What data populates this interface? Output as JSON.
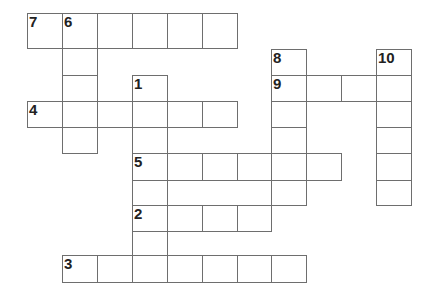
{
  "puzzle": {
    "type": "crossword",
    "colors": {
      "border": "#6e6e6e",
      "background": "#ffffff",
      "number": "#222222"
    },
    "col_x": [
      27,
      62,
      97,
      132,
      167,
      202,
      237,
      271,
      306,
      341,
      376,
      411
    ],
    "row_y": [
      13,
      48,
      75,
      101,
      127,
      153,
      180,
      205,
      231,
      255,
      282
    ],
    "cells": [
      {
        "c": 0,
        "r": 0,
        "n": "7"
      },
      {
        "c": 1,
        "r": 0,
        "n": "6"
      },
      {
        "c": 2,
        "r": 0
      },
      {
        "c": 3,
        "r": 0
      },
      {
        "c": 4,
        "r": 0
      },
      {
        "c": 5,
        "r": 0
      },
      {
        "c": 1,
        "r": 1
      },
      {
        "c": 1,
        "r": 2
      },
      {
        "c": 1,
        "r": 3
      },
      {
        "c": 1,
        "r": 4
      },
      {
        "c": 3,
        "r": 2,
        "n": "1"
      },
      {
        "c": 0,
        "r": 3,
        "n": "4"
      },
      {
        "c": 2,
        "r": 3
      },
      {
        "c": 3,
        "r": 3
      },
      {
        "c": 4,
        "r": 3
      },
      {
        "c": 5,
        "r": 3
      },
      {
        "c": 3,
        "r": 4
      },
      {
        "c": 3,
        "r": 5,
        "n": "5"
      },
      {
        "c": 4,
        "r": 5
      },
      {
        "c": 5,
        "r": 5
      },
      {
        "c": 6,
        "r": 5
      },
      {
        "c": 7,
        "r": 5
      },
      {
        "c": 8,
        "r": 5
      },
      {
        "c": 3,
        "r": 6
      },
      {
        "c": 3,
        "r": 7,
        "n": "2"
      },
      {
        "c": 4,
        "r": 7
      },
      {
        "c": 5,
        "r": 7
      },
      {
        "c": 6,
        "r": 7
      },
      {
        "c": 3,
        "r": 8
      },
      {
        "c": 1,
        "r": 9,
        "n": "3"
      },
      {
        "c": 2,
        "r": 9
      },
      {
        "c": 3,
        "r": 9
      },
      {
        "c": 4,
        "r": 9
      },
      {
        "c": 5,
        "r": 9
      },
      {
        "c": 6,
        "r": 9
      },
      {
        "c": 7,
        "r": 9
      },
      {
        "c": 7,
        "r": 1,
        "n": "8",
        "y": 49
      },
      {
        "c": 7,
        "r": 2,
        "n": "9"
      },
      {
        "c": 8,
        "r": 2
      },
      {
        "c": 9,
        "r": 2
      },
      {
        "c": 7,
        "r": 3
      },
      {
        "c": 7,
        "r": 4
      },
      {
        "c": 7,
        "r": 6
      },
      {
        "c": 10,
        "r": 1,
        "n": "10",
        "y": 49
      },
      {
        "c": 10,
        "r": 2
      },
      {
        "c": 10,
        "r": 3
      },
      {
        "c": 10,
        "r": 4
      },
      {
        "c": 10,
        "r": 5
      },
      {
        "c": 10,
        "r": 6
      }
    ]
  },
  "clue_numbers": [
    "1",
    "2",
    "3",
    "4",
    "5",
    "6",
    "7",
    "8",
    "9",
    "10"
  ],
  "entries": {
    "across": [
      {
        "number": "7",
        "length": 6
      },
      {
        "number": "9",
        "length": 4
      },
      {
        "number": "4",
        "length": 6
      },
      {
        "number": "5",
        "length": 6
      },
      {
        "number": "2",
        "length": 4
      },
      {
        "number": "3",
        "length": 7
      }
    ],
    "down": [
      {
        "number": "6",
        "length": 5
      },
      {
        "number": "8",
        "length": 6
      },
      {
        "number": "10",
        "length": 6
      },
      {
        "number": "1",
        "length": 7
      }
    ]
  }
}
